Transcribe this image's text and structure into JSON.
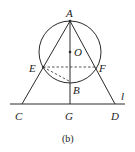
{
  "diagram": {
    "caption": "(b)",
    "points": {
      "A": {
        "label": "A",
        "x": 70,
        "y": 21
      },
      "O": {
        "label": "O",
        "x": 70,
        "y": 52
      },
      "E": {
        "label": "E",
        "x": 43,
        "y": 67
      },
      "F": {
        "label": "F",
        "x": 96,
        "y": 67
      },
      "B": {
        "label": "B",
        "x": 70,
        "y": 82
      },
      "C": {
        "label": "C",
        "x": 22,
        "y": 104
      },
      "G": {
        "label": "G",
        "x": 70,
        "y": 104
      },
      "D": {
        "label": "D",
        "x": 115,
        "y": 104
      }
    },
    "line_label": "l",
    "circle": {
      "center": "O",
      "radius": 31
    },
    "segments": [
      "AC",
      "AD",
      "AG"
    ],
    "dashed_segments": [
      "EF",
      "EB"
    ],
    "colors": {
      "stroke": "#2a2a2a",
      "text": "#222222"
    }
  }
}
